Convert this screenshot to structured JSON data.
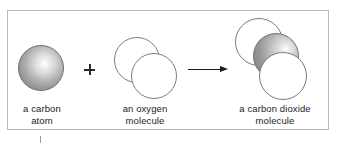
{
  "figure": {
    "frame_color": "#b9b9b9",
    "background": "#ffffff"
  },
  "operators": {
    "plus": "+",
    "arrow": "right-arrow"
  },
  "items": [
    {
      "id": "carbon-atom",
      "label": "a carbon\natom",
      "atoms": [
        {
          "element": "C",
          "fill": "gray-gradient",
          "outline": "#6e6e6e"
        }
      ]
    },
    {
      "id": "oxygen-molecule",
      "label": "an oxygen\nmolecule",
      "atoms": [
        {
          "element": "O",
          "fill": "#ffffff",
          "outline": "#7c7c7c"
        },
        {
          "element": "O",
          "fill": "#ffffff",
          "outline": "#7c7c7c"
        }
      ]
    },
    {
      "id": "carbon-dioxide-molecule",
      "label": "a carbon dioxide\nmolecule",
      "atoms": [
        {
          "element": "O",
          "fill": "#ffffff",
          "outline": "#7c7c7c"
        },
        {
          "element": "C",
          "fill": "gray-gradient",
          "outline": "#6e6e6e"
        },
        {
          "element": "O",
          "fill": "#ffffff",
          "outline": "#7c7c7c"
        }
      ]
    }
  ]
}
